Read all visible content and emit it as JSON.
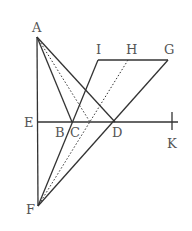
{
  "diagram": {
    "points": {
      "A": {
        "label": "A",
        "x": 37,
        "y": 37
      },
      "I": {
        "label": "I",
        "x": 98,
        "y": 60
      },
      "H": {
        "label": "H",
        "x": 128,
        "y": 60
      },
      "G": {
        "label": "G",
        "x": 168,
        "y": 60
      },
      "E": {
        "label": "E",
        "x": 37,
        "y": 122
      },
      "B": {
        "label": "B",
        "x": 72,
        "y": 122
      },
      "C": {
        "label": "C",
        "x": 72,
        "y": 122
      },
      "D": {
        "label": "D",
        "x": 115,
        "y": 122
      },
      "K": {
        "label": "K",
        "x": 172,
        "y": 122
      },
      "F": {
        "label": "F",
        "x": 38,
        "y": 206
      }
    },
    "solid_segments": [
      [
        "A",
        "F"
      ],
      [
        "A",
        "C"
      ],
      [
        "A",
        "D"
      ],
      [
        "I",
        "G"
      ],
      [
        "I",
        "F"
      ],
      [
        "G",
        "F"
      ],
      [
        "E",
        "K"
      ]
    ],
    "dotted_segments": [
      [
        "A",
        "X"
      ],
      [
        "H",
        "F"
      ]
    ],
    "line_color": "#333333",
    "label_color": "#555555"
  }
}
